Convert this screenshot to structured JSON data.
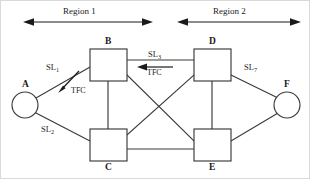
{
  "figure": {
    "type": "network-topology-diagram",
    "background": "#ffffff",
    "line_color": "#3a3a3a",
    "text_color": "#1a1a1a"
  },
  "regions": [
    {
      "id": "region-1",
      "label": "Region 1",
      "span_x": [
        22,
        152
      ],
      "y": 21
    },
    {
      "id": "region-2",
      "label": "Region 2",
      "span_x": [
        176,
        300
      ],
      "y": 21
    }
  ],
  "nodes": [
    {
      "id": "A",
      "label": "A",
      "shape": "circle",
      "cx": 24,
      "cy": 104,
      "r": 13,
      "label_x": 21,
      "label_y": 79
    },
    {
      "id": "B",
      "label": "B",
      "shape": "square",
      "x": 89,
      "y": 48,
      "w": 37,
      "h": 32,
      "label_x": 104,
      "label_y": 36
    },
    {
      "id": "C",
      "label": "C",
      "shape": "square",
      "x": 89,
      "y": 128,
      "w": 37,
      "h": 32,
      "label_x": 104,
      "label_y": 162
    },
    {
      "id": "D",
      "label": "D",
      "shape": "square",
      "x": 193,
      "y": 48,
      "w": 37,
      "h": 32,
      "label_x": 208,
      "label_y": 36
    },
    {
      "id": "E",
      "label": "E",
      "shape": "square",
      "x": 193,
      "y": 128,
      "w": 37,
      "h": 32,
      "label_x": 208,
      "label_y": 162
    },
    {
      "id": "F",
      "label": "F",
      "shape": "circle",
      "cx": 286,
      "cy": 104,
      "r": 13,
      "label_x": 283,
      "label_y": 79
    }
  ],
  "links": [
    {
      "id": "A-B",
      "from": "A",
      "to": "B",
      "label": "SL",
      "subscript": "1",
      "label_x": 45,
      "label_y": 62
    },
    {
      "id": "A-C",
      "from": "A",
      "to": "C",
      "label": "SL",
      "subscript": "2",
      "label_x": 40,
      "label_y": 124
    },
    {
      "id": "B-D",
      "from": "B",
      "to": "D",
      "label": "SL",
      "subscript": "3",
      "label_x": 147,
      "label_y": 49
    },
    {
      "id": "D-F",
      "from": "D",
      "to": "F",
      "label": "SL",
      "subscript": "7",
      "label_x": 243,
      "label_y": 62
    },
    {
      "id": "B-C",
      "from": "B",
      "to": "C",
      "label": "",
      "subscript": ""
    },
    {
      "id": "D-E",
      "from": "D",
      "to": "E",
      "label": "",
      "subscript": ""
    },
    {
      "id": "C-E",
      "from": "C",
      "to": "E",
      "label": "",
      "subscript": ""
    },
    {
      "id": "B-E",
      "from": "B",
      "to": "E",
      "label": "",
      "subscript": ""
    },
    {
      "id": "C-D",
      "from": "C",
      "to": "D",
      "label": "",
      "subscript": ""
    },
    {
      "id": "C-F",
      "from": "C",
      "to": "F",
      "label": "",
      "subscript": ""
    },
    {
      "id": "E-F",
      "from": "E",
      "to": "F",
      "label": "",
      "subscript": ""
    }
  ],
  "flow_annotations": [
    {
      "id": "tfc-a",
      "label": "TFC",
      "direction": "toward-A",
      "label_x": 70,
      "label_y": 89
    },
    {
      "id": "tfc-bd",
      "label": "TFC",
      "direction": "toward-B",
      "label_x": 146,
      "label_y": 67
    }
  ]
}
